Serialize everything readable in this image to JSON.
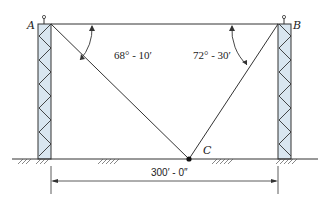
{
  "diagram": {
    "labels": {
      "point_a": "A",
      "point_b": "B",
      "point_c": "C"
    },
    "angles": {
      "at_a": "68° - 10′",
      "at_b": "72° - 30′"
    },
    "dimension": {
      "span": "300′ - 0″"
    },
    "colors": {
      "line": "#333333",
      "tower_fill": "#d9e6f0"
    }
  }
}
